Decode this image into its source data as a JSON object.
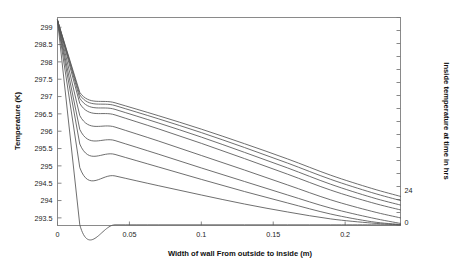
{
  "figure": {
    "background_color": "#ffffff",
    "frame_color": "#808080",
    "curve_color": "#555555"
  },
  "chart_data": {
    "type": "line",
    "title": "",
    "xlabel": "Width of wall From outside to inside  (m)",
    "ylabel": "Temperature (K)",
    "y2label": "Inside temperature at time in hrs",
    "xlim": [
      0,
      0.2385
    ],
    "ylim": [
      293.28,
      299.28
    ],
    "xticks": [
      0,
      0.05,
      0.1,
      0.15,
      0.2
    ],
    "xticklabels": [
      "0",
      "0.05",
      "0.1",
      "0.15",
      "0.2"
    ],
    "yticks": [
      293.5,
      294,
      294.5,
      295,
      295.5,
      296,
      296.5,
      297,
      297.5,
      298,
      298.5,
      299
    ],
    "yticklabels": [
      "293.5",
      "294",
      "294.5",
      "295",
      "295.5",
      "296",
      "296.5",
      "297",
      "297.5",
      "298",
      "298.5",
      "299"
    ],
    "y2ticks": [
      24,
      0
    ],
    "y2ticklabels": [
      "24",
      "0"
    ],
    "grid": false,
    "legend": "none",
    "x": [
      0,
      0.0155,
      0.04,
      0.07,
      0.1,
      0.13,
      0.16,
      0.19,
      0.2185,
      0.2385
    ],
    "series": [
      {
        "name": "t = 24 hrs",
        "values": [
          299.2,
          297.12,
          296.82,
          296.45,
          296.06,
          295.64,
          295.2,
          294.73,
          294.35,
          294.12
        ]
      },
      {
        "name": "t = 21 hrs",
        "values": [
          299.2,
          297.05,
          296.74,
          296.36,
          295.96,
          295.53,
          295.08,
          294.61,
          294.23,
          294.0
        ]
      },
      {
        "name": "t = 18 hrs",
        "values": [
          299.2,
          296.95,
          296.63,
          296.24,
          295.83,
          295.39,
          294.94,
          294.47,
          294.09,
          293.87
        ]
      },
      {
        "name": "t = 15 hrs",
        "values": [
          299.2,
          296.8,
          296.47,
          296.07,
          295.65,
          295.21,
          294.76,
          294.3,
          293.94,
          293.73
        ]
      },
      {
        "name": "t = 12 hrs",
        "values": [
          299.2,
          296.45,
          296.12,
          295.72,
          295.3,
          294.88,
          294.45,
          294.02,
          293.69,
          293.5
        ]
      },
      {
        "name": "t = 9 hrs",
        "values": [
          299.2,
          296.05,
          295.73,
          295.34,
          294.94,
          294.55,
          294.16,
          293.78,
          293.5,
          293.34
        ]
      },
      {
        "name": "t = 6 hrs",
        "values": [
          299.2,
          295.63,
          295.33,
          294.97,
          294.61,
          294.26,
          293.93,
          293.61,
          293.39,
          293.31
        ]
      },
      {
        "name": "t = 3 hrs",
        "values": [
          299.2,
          294.95,
          294.71,
          294.43,
          294.16,
          293.9,
          293.67,
          293.47,
          293.35,
          293.3
        ]
      },
      {
        "name": "t = 0 hrs",
        "values": [
          299.2,
          293.3,
          293.3,
          293.3,
          293.3,
          293.3,
          293.3,
          293.3,
          293.3,
          293.3
        ]
      }
    ]
  }
}
